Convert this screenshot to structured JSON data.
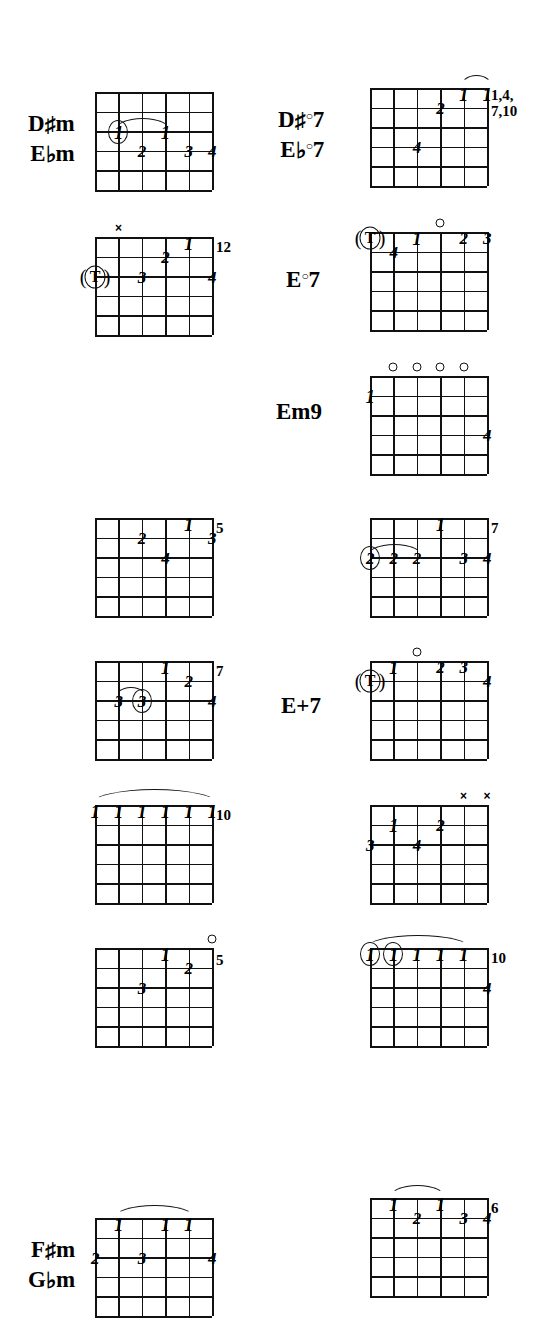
{
  "page": {
    "type": "guitar-chord-chart",
    "width": 543,
    "height": 1326,
    "ink_color": "#111111",
    "paper_color": "#ffffff",
    "grid": {
      "strings": 6,
      "frets": 5
    }
  },
  "chords": [
    {
      "id": "dsharp-m",
      "name_lines": [
        "D#m",
        "Ebm"
      ],
      "label_html_parts": [
        {
          "root": "D",
          "accidental": "♯",
          "suffix": "m"
        },
        {
          "root": "E",
          "accidental": "♭",
          "suffix": "m"
        }
      ],
      "fret_marker": "",
      "open_strings": [],
      "muted_strings": [],
      "fingers": [
        {
          "string": 2,
          "fret": 3,
          "text": "1",
          "circled": true
        },
        {
          "string": 4,
          "fret": 3,
          "text": "1"
        },
        {
          "string": 3,
          "fret": 4,
          "text": "2"
        },
        {
          "string": 5,
          "fret": 4,
          "text": "3"
        },
        {
          "string": 6,
          "fret": 4,
          "text": "4"
        }
      ],
      "barre": {
        "from_string": 2,
        "to_string": 4,
        "fret": 3
      }
    },
    {
      "id": "dsharp-m-12",
      "name_lines": [],
      "fret_marker": "12",
      "open_strings": [],
      "muted_strings": [
        2
      ],
      "fingers": [
        {
          "string": 5,
          "fret": 1,
          "text": "1"
        },
        {
          "string": 4,
          "fret": 2,
          "text": "2"
        },
        {
          "string": 3,
          "fret": 3,
          "text": "3"
        },
        {
          "string": 6,
          "fret": 3,
          "text": "4"
        }
      ],
      "thumb": {
        "string": 1,
        "fret": 3,
        "text": "T"
      }
    },
    {
      "id": "dsharp-m-5",
      "name_lines": [],
      "fret_marker": "5",
      "open_strings": [],
      "muted_strings": [],
      "fingers": [
        {
          "string": 5,
          "fret": 1,
          "text": "1"
        },
        {
          "string": 3,
          "fret": 2,
          "text": "2"
        },
        {
          "string": 6,
          "fret": 2,
          "text": "3"
        },
        {
          "string": 4,
          "fret": 3,
          "text": "4"
        }
      ]
    },
    {
      "id": "dsharp-m-7",
      "name_lines": [],
      "fret_marker": "7",
      "open_strings": [],
      "muted_strings": [],
      "fingers": [
        {
          "string": 4,
          "fret": 1,
          "text": "1"
        },
        {
          "string": 5,
          "fret": 2,
          "text": "2"
        },
        {
          "string": 2,
          "fret": 3,
          "text": "3"
        },
        {
          "string": 3,
          "fret": 3,
          "text": "3",
          "circled": true
        },
        {
          "string": 6,
          "fret": 3,
          "text": "4"
        }
      ],
      "barre": {
        "from_string": 2,
        "to_string": 3,
        "fret": 3
      }
    },
    {
      "id": "dsharp-m-10-barre",
      "name_lines": [],
      "fret_marker": "10",
      "open_strings": [],
      "muted_strings": [],
      "fingers": [
        {
          "string": 1,
          "fret": 1,
          "text": "1"
        },
        {
          "string": 2,
          "fret": 1,
          "text": "1"
        },
        {
          "string": 3,
          "fret": 1,
          "text": "1"
        },
        {
          "string": 4,
          "fret": 1,
          "text": "1"
        },
        {
          "string": 5,
          "fret": 1,
          "text": "1"
        },
        {
          "string": 6,
          "fret": 1,
          "text": "1"
        }
      ],
      "barre": {
        "from_string": 1,
        "to_string": 6,
        "fret": 1,
        "full": true
      }
    },
    {
      "id": "dsharp-m-5b",
      "name_lines": [],
      "fret_marker": "5",
      "open_strings": [
        6
      ],
      "muted_strings": [],
      "fingers": [
        {
          "string": 4,
          "fret": 1,
          "text": "1"
        },
        {
          "string": 5,
          "fret": 2,
          "text": "2"
        },
        {
          "string": 3,
          "fret": 3,
          "text": "3"
        }
      ]
    },
    {
      "id": "fsharp-m",
      "name_lines": [
        "F#m",
        "Gbm"
      ],
      "label_html_parts": [
        {
          "root": "F",
          "accidental": "♯",
          "suffix": "m"
        },
        {
          "root": "G",
          "accidental": "♭",
          "suffix": "m"
        }
      ],
      "fret_marker": "",
      "open_strings": [],
      "muted_strings": [],
      "fingers": [
        {
          "string": 2,
          "fret": 1,
          "text": "1"
        },
        {
          "string": 4,
          "fret": 1,
          "text": "1"
        },
        {
          "string": 5,
          "fret": 1,
          "text": "1"
        },
        {
          "string": 1,
          "fret": 3,
          "text": "2"
        },
        {
          "string": 3,
          "fret": 3,
          "text": "3"
        },
        {
          "string": 6,
          "fret": 3,
          "text": "4"
        }
      ],
      "barre": {
        "from_string": 2,
        "to_string": 5,
        "fret": 1
      }
    },
    {
      "id": "dsharp-dim7",
      "name_lines": [
        "D#°7",
        "Eb°7"
      ],
      "label_html_parts": [
        {
          "root": "D",
          "accidental": "♯",
          "dim": true,
          "suffix": "7"
        },
        {
          "root": "E",
          "accidental": "♭",
          "dim": true,
          "suffix": "7"
        }
      ],
      "fret_marker": "1,4,\n7,10",
      "open_strings": [],
      "muted_strings": [],
      "fingers": [
        {
          "string": 5,
          "fret": 1,
          "text": "1"
        },
        {
          "string": 6,
          "fret": 1,
          "text": "1"
        },
        {
          "string": 4,
          "fret": 2,
          "text": "2"
        },
        {
          "string": 3,
          "fret": 4,
          "text": "4"
        }
      ],
      "barre": {
        "from_string": 5,
        "to_string": 6,
        "fret": 1
      }
    },
    {
      "id": "e-dim7",
      "name_lines": [
        "E°7"
      ],
      "label_html_parts": [
        {
          "root": "E",
          "dim": true,
          "suffix": "7"
        }
      ],
      "fret_marker": "",
      "open_strings": [
        4
      ],
      "muted_strings": [],
      "fingers": [
        {
          "string": 3,
          "fret": 1,
          "text": "1"
        },
        {
          "string": 5,
          "fret": 1,
          "text": "2"
        },
        {
          "string": 6,
          "fret": 1,
          "text": "3"
        },
        {
          "string": 2,
          "fret": 2,
          "text": "4"
        }
      ],
      "thumb": {
        "string": 1,
        "fret": 1,
        "text": "T"
      }
    },
    {
      "id": "em9",
      "name_lines": [
        "Em9"
      ],
      "fret_marker": "",
      "open_strings": [
        2,
        3,
        4,
        5
      ],
      "muted_strings": [],
      "fingers": [
        {
          "string": 1,
          "fret": 2,
          "text": "1"
        },
        {
          "string": 6,
          "fret": 4,
          "text": "4"
        }
      ]
    },
    {
      "id": "e-7-barre",
      "name_lines": [],
      "fret_marker": "7",
      "open_strings": [],
      "muted_strings": [],
      "fingers": [
        {
          "string": 4,
          "fret": 1,
          "text": "1"
        },
        {
          "string": 1,
          "fret": 3,
          "text": "2",
          "circled": true
        },
        {
          "string": 2,
          "fret": 3,
          "text": "2"
        },
        {
          "string": 3,
          "fret": 3,
          "text": "2"
        },
        {
          "string": 5,
          "fret": 3,
          "text": "3"
        },
        {
          "string": 6,
          "fret": 3,
          "text": "4"
        }
      ],
      "barre": {
        "from_string": 1,
        "to_string": 3,
        "fret": 3
      }
    },
    {
      "id": "e-plus-7",
      "name_lines": [
        "E+7"
      ],
      "fret_marker": "",
      "open_strings": [
        3
      ],
      "muted_strings": [],
      "fingers": [
        {
          "string": 2,
          "fret": 1,
          "text": "1"
        },
        {
          "string": 4,
          "fret": 1,
          "text": "2"
        },
        {
          "string": 5,
          "fret": 1,
          "text": "3"
        },
        {
          "string": 6,
          "fret": 2,
          "text": "4"
        }
      ],
      "thumb": {
        "string": 1,
        "fret": 2,
        "text": "T"
      }
    },
    {
      "id": "e-xx",
      "name_lines": [],
      "fret_marker": "",
      "open_strings": [],
      "muted_strings": [
        5,
        6
      ],
      "fingers": [
        {
          "string": 2,
          "fret": 2,
          "text": "1"
        },
        {
          "string": 4,
          "fret": 2,
          "text": "2"
        },
        {
          "string": 1,
          "fret": 3,
          "text": "3"
        },
        {
          "string": 3,
          "fret": 3,
          "text": "4"
        }
      ]
    },
    {
      "id": "e-10-barre",
      "name_lines": [],
      "fret_marker": "10",
      "open_strings": [],
      "muted_strings": [],
      "fingers": [
        {
          "string": 1,
          "fret": 1,
          "text": "1",
          "circled": true
        },
        {
          "string": 2,
          "fret": 1,
          "text": "1",
          "circled": true
        },
        {
          "string": 3,
          "fret": 1,
          "text": "1"
        },
        {
          "string": 4,
          "fret": 1,
          "text": "1"
        },
        {
          "string": 5,
          "fret": 1,
          "text": "1"
        },
        {
          "string": 6,
          "fret": 3,
          "text": "4"
        }
      ],
      "barre": {
        "from_string": 1,
        "to_string": 5,
        "fret": 1
      }
    },
    {
      "id": "fsharp-m-6",
      "name_lines": [],
      "fret_marker": "6",
      "open_strings": [],
      "muted_strings": [],
      "fingers": [
        {
          "string": 2,
          "fret": 1,
          "text": "1"
        },
        {
          "string": 4,
          "fret": 1,
          "text": "1"
        },
        {
          "string": 3,
          "fret": 2,
          "text": "2"
        },
        {
          "string": 5,
          "fret": 2,
          "text": "3"
        },
        {
          "string": 6,
          "fret": 2,
          "text": "4"
        }
      ],
      "barre": {
        "from_string": 2,
        "to_string": 4,
        "fret": 1
      }
    }
  ]
}
